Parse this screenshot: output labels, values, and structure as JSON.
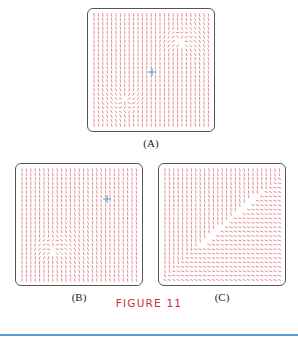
{
  "figure": {
    "caption": "FIGURE 11",
    "caption_color": "#c8303a",
    "rule_color": "#5b9bd5",
    "arrow_color": "#e0707a",
    "marker_color": "#4aa0c8"
  },
  "panels": [
    {
      "id": "A",
      "label": "(A)",
      "box": [
        87,
        8,
        128,
        124
      ],
      "singularities": [
        [
          93,
          34,
          1
        ],
        [
          37,
          90,
          -1
        ]
      ],
      "marker": [
        64,
        63
      ],
      "mode": "dipole"
    },
    {
      "id": "B",
      "label": "(B)",
      "box": [
        15,
        163,
        128,
        123
      ],
      "singularities": [
        [
          37,
          87,
          1
        ]
      ],
      "marker": [
        91,
        35
      ],
      "mode": "source"
    },
    {
      "id": "C",
      "label": "(C)",
      "box": [
        158,
        163,
        128,
        123
      ],
      "singularities": [
        [
          37,
          85,
          0
        ],
        [
          104,
          27,
          0
        ]
      ],
      "marker": null,
      "mode": "diagonal"
    }
  ]
}
